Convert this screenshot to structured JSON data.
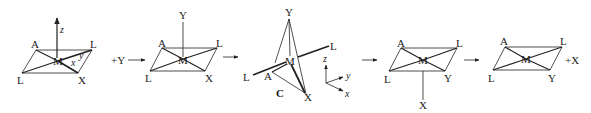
{
  "figure": {
    "structures": [
      {
        "id": "s1",
        "atoms": {
          "top_left": "A",
          "top_right": "L",
          "center": "M",
          "bottom_left": "L",
          "bottom_right": "X"
        },
        "axis_label": "z",
        "angle_labels": {
          "x": "x",
          "y": "y"
        }
      },
      {
        "id": "s2",
        "atoms": {
          "apex": "Y",
          "top_left": "A",
          "top_right": "L",
          "center": "M",
          "bottom_left": "L",
          "bottom_right": "X"
        }
      },
      {
        "id": "s3",
        "caption": "C",
        "atoms": {
          "apex": "Y",
          "right": "L",
          "center": "M",
          "left": "L",
          "front": "A",
          "bottom": "X"
        },
        "axes": {
          "z": "z",
          "y": "y",
          "x": "x"
        }
      },
      {
        "id": "s4",
        "atoms": {
          "top_left": "A",
          "top_right": "L",
          "center": "M",
          "bottom_left": "L",
          "bottom_right": "Y",
          "below": "X"
        }
      },
      {
        "id": "s5",
        "atoms": {
          "top_left": "A",
          "top_right": "L",
          "center": "M",
          "bottom_left": "L",
          "bottom_right": "Y"
        }
      }
    ],
    "steps": [
      {
        "label": "+Y"
      },
      {
        "label": ""
      },
      {
        "label": ""
      },
      {
        "label": ""
      }
    ],
    "product_suffix": "+X"
  }
}
